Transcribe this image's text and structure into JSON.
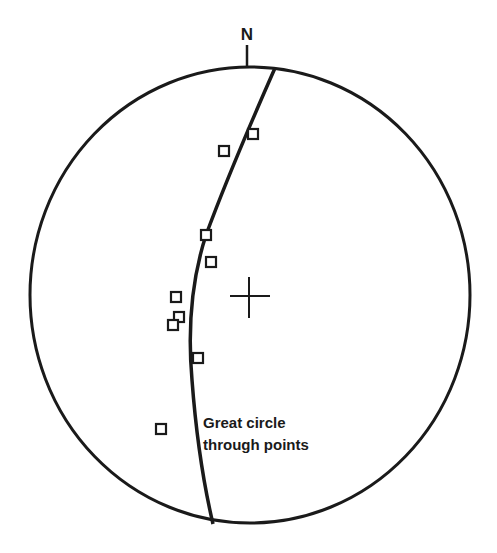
{
  "diagram": {
    "type": "stereonet",
    "north_label": "N",
    "annotation_line1": "Great circle",
    "annotation_line2": "through points",
    "ink_color": "#1a1a1a",
    "background": "#ffffff",
    "center": [
      250,
      295
    ],
    "radius": [
      220,
      228
    ],
    "points": [
      [
        253,
        134
      ],
      [
        224,
        151
      ],
      [
        206,
        235
      ],
      [
        211,
        262
      ],
      [
        176,
        297
      ],
      [
        179,
        317
      ],
      [
        173,
        325
      ],
      [
        198,
        358
      ],
      [
        161,
        429
      ]
    ]
  }
}
